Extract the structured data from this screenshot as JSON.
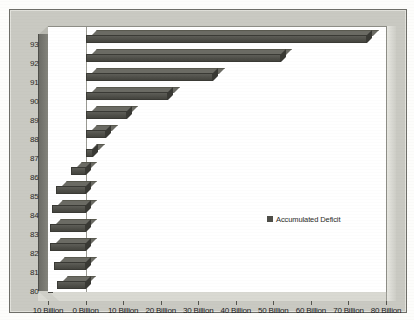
{
  "chart_data": {
    "type": "bar",
    "orientation": "horizontal",
    "title": "",
    "subtitle": "",
    "xlabel": "",
    "ylabel": "",
    "categories": [
      "80",
      "81",
      "82",
      "83",
      "84",
      "85",
      "86",
      "87",
      "88",
      "89",
      "90",
      "91",
      "92",
      "93"
    ],
    "values": [
      -7.5,
      -8.5,
      -9.5,
      -9.5,
      -9.0,
      -8.0,
      -4.0,
      2.0,
      5.5,
      11.0,
      22.0,
      34.0,
      52.0,
      75.0
    ],
    "series": [
      {
        "name": "Accumulated Deficit",
        "color": "#4e4e48",
        "values": [
          -7.5,
          -8.5,
          -9.5,
          -9.5,
          -9.0,
          -8.0,
          -4.0,
          2.0,
          5.5,
          11.0,
          22.0,
          34.0,
          52.0,
          75.0
        ]
      }
    ],
    "x_tick_values": [
      -10,
      0,
      10,
      20,
      30,
      40,
      50,
      60,
      70,
      80
    ],
    "x_tick_labels": [
      "10 Billion",
      "0 Billion",
      "10 Billion",
      "20 Billion",
      "30 Billion",
      "40 Billion",
      "50 Billion",
      "60 Billion",
      "70 Billion",
      "80 Billion"
    ],
    "y_tick_labels": [
      "93",
      "92",
      "91",
      "90",
      "89",
      "88",
      "87",
      "86",
      "85",
      "84",
      "83",
      "82",
      "81",
      "80"
    ],
    "xlim": [
      -10,
      80
    ],
    "grid": false,
    "legend": {
      "position": "center-right",
      "entries": [
        {
          "label": "Accumulated Deficit",
          "color": "#4e4e48",
          "marker": "square-swatch"
        }
      ]
    },
    "units": "Billion"
  },
  "legend": {
    "label": "Accumulated Deficit"
  },
  "colors": {
    "bar": "#4e4e48",
    "bar_top": "#6b6b64",
    "bar_side": "#393934",
    "plot_background": "#ffffff",
    "frame_background": "#c9c9c2",
    "axis_text": "#22221f",
    "zero_line": "#9a9a93"
  }
}
